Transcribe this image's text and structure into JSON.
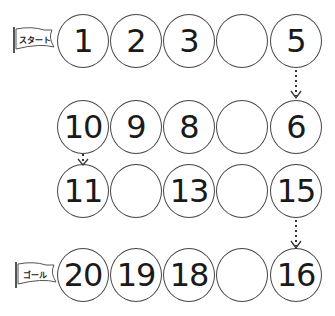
{
  "start_flag": {
    "label": "スタート"
  },
  "goal_flag": {
    "label": "ゴール"
  },
  "rows": [
    {
      "cells": [
        "1",
        "2",
        "3",
        "",
        "5"
      ]
    },
    {
      "cells": [
        "10",
        "9",
        "8",
        "",
        "6"
      ]
    },
    {
      "cells": [
        "11",
        "",
        "13",
        "",
        "15"
      ]
    },
    {
      "cells": [
        "20",
        "19",
        "18",
        "",
        "16"
      ]
    }
  ],
  "colors": {
    "line": "#444444",
    "text": "#1a1a1a"
  }
}
